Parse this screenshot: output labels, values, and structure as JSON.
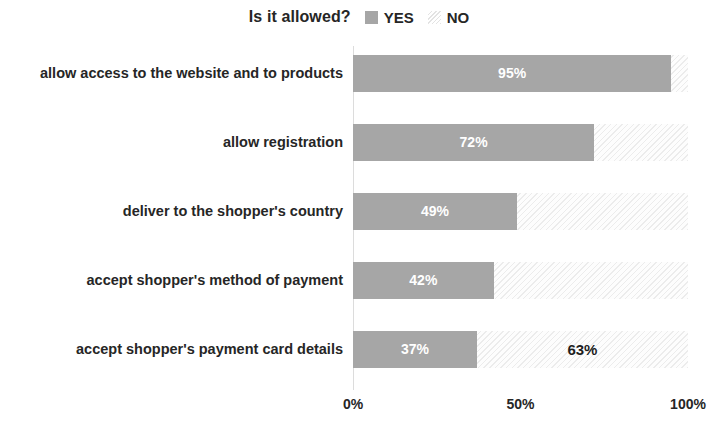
{
  "chart_data": {
    "type": "bar",
    "title": "Is it allowed?",
    "orientation": "horizontal",
    "stacked": true,
    "xlabel": "",
    "ylabel": "",
    "xlim": [
      0,
      100
    ],
    "grid": false,
    "legend_position": "top",
    "legend": [
      {
        "name": "YES",
        "color": "#a6a6a6",
        "swatch": "solid-square-icon"
      },
      {
        "name": "NO",
        "color": "#f2f2f2",
        "swatch": "hatched-square-icon"
      }
    ],
    "categories": [
      "allow access to the website and to products",
      "allow registration",
      "deliver to the shopper's country",
      "accept shopper's method of payment",
      "accept shopper's payment card details"
    ],
    "series": [
      {
        "name": "YES",
        "values": [
          95,
          72,
          49,
          42,
          37
        ]
      },
      {
        "name": "NO",
        "values": [
          5,
          28,
          51,
          58,
          63
        ]
      }
    ],
    "value_labels_yes": [
      "95%",
      "72%",
      "49%",
      "42%",
      "37%"
    ],
    "value_labels_no": [
      "",
      "",
      "",
      "",
      "63%"
    ],
    "tick_labels": [
      "0%",
      "50%",
      "100%"
    ],
    "tick_values": [
      0,
      50,
      100
    ]
  }
}
